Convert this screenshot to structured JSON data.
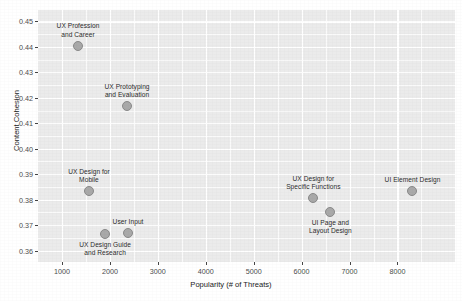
{
  "chart_data": {
    "type": "scatter",
    "title": "",
    "xlabel": "Popularity (# of Threats)",
    "ylabel": "Content Cohesion",
    "xlim": [
      500,
      9200
    ],
    "ylim": [
      0.3555,
      0.4545
    ],
    "grid": true,
    "legend": false,
    "xticks": [
      1000,
      2000,
      3000,
      4000,
      5000,
      6000,
      7000,
      8000
    ],
    "xtick_labels": [
      "1000",
      "2000",
      "3000",
      "4000",
      "5000",
      "6000",
      "7000",
      "8000"
    ],
    "yticks": [
      0.36,
      0.37,
      0.38,
      0.39,
      0.4,
      0.41,
      0.42,
      0.43,
      0.44,
      0.45
    ],
    "ytick_labels": [
      "0.36",
      "0.37",
      "0.38",
      "0.39",
      "0.40",
      "0.41",
      "0.42",
      "0.43",
      "0.44",
      "0.45"
    ],
    "marker_fill": "#a9a9a9",
    "marker_edge": "#8a8a8a",
    "panel_background": "#ebebeb",
    "gridline_color": "#ffffff",
    "points": [
      {
        "label": "UX Profession\nand Career",
        "x": 1334,
        "y": 0.4404,
        "label_position": "above"
      },
      {
        "label": "UX Prototyping\nand Evaluation",
        "x": 2358,
        "y": 0.4167,
        "label_position": "above"
      },
      {
        "label": "UX Design for\nMobile",
        "x": 1564,
        "y": 0.3833,
        "label_position": "above"
      },
      {
        "label": "UX Design Guide\nand Research",
        "x": 1899,
        "y": 0.3666,
        "label_position": "below"
      },
      {
        "label": "User Input",
        "x": 2379,
        "y": 0.367,
        "label_position": "above"
      },
      {
        "label": "UX Design for\nSpecific Functions",
        "x": 6245,
        "y": 0.3805,
        "label_position": "above"
      },
      {
        "label": "UI Page and\nLayout Design",
        "x": 6600,
        "y": 0.3753,
        "label_position": "below"
      },
      {
        "label": "UI Element Design",
        "x": 8313,
        "y": 0.3833,
        "label_position": "above"
      }
    ]
  }
}
